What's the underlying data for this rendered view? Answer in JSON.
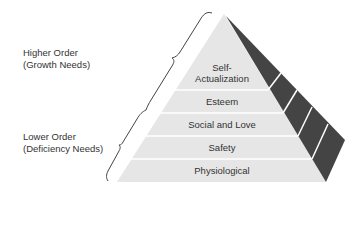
{
  "diagram": {
    "type": "pyramid",
    "title": "",
    "groups": [
      {
        "line1": "Higher Order",
        "line2": "(Growth Needs)"
      },
      {
        "line1": "Lower Order",
        "line2": "(Deficiency Needs)"
      }
    ],
    "levels": [
      {
        "line1": "Self-",
        "line2": "Actualization"
      },
      {
        "label": "Esteem"
      },
      {
        "label": "Social and Love"
      },
      {
        "label": "Safety"
      },
      {
        "label": "Physiological"
      }
    ],
    "colors": {
      "front": "#e8e8e8",
      "side": "#444444",
      "divider": "#ffffff",
      "text": "#333333"
    }
  }
}
